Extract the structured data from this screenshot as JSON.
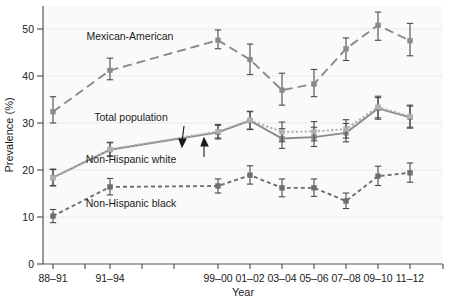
{
  "chart_data": {
    "type": "line",
    "title": "",
    "xlabel": "Year",
    "ylabel": "Prevalence (%)",
    "categories": [
      "88–91",
      "91–94",
      "99–00",
      "01–02",
      "03–04",
      "05–06",
      "07–08",
      "09–10",
      "11–12"
    ],
    "x_positions": [
      53,
      110,
      218,
      250,
      282,
      314,
      346,
      378,
      410
    ],
    "ylim": [
      0,
      54
    ],
    "yticks": [
      0,
      10,
      20,
      30,
      40,
      50
    ],
    "ytick_labels": [
      "0",
      "10",
      "20",
      "30",
      "40",
      "50"
    ],
    "grid": "horizontal-light",
    "legend": "inline-annotations",
    "series": [
      {
        "name": "Mexican-American",
        "style": "long-dash",
        "color": "#8a8a8a",
        "values": [
          32.4,
          41.2,
          47.6,
          43.5,
          37.0,
          38.3,
          45.8,
          50.8,
          47.5
        ],
        "err_low": [
          30.0,
          39.2,
          45.8,
          40.3,
          33.8,
          35.6,
          43.3,
          47.6,
          44.3
        ],
        "err_high": [
          35.6,
          43.8,
          49.8,
          46.8,
          40.6,
          41.4,
          48.1,
          53.6,
          51.2
        ]
      },
      {
        "name": "Total population",
        "style": "solid",
        "color": "#8a8a8a",
        "values": [
          18.4,
          24.3,
          28.0,
          30.5,
          26.7,
          27.0,
          27.9,
          33.1,
          31.2
        ],
        "err_low": [
          16.7,
          22.9,
          26.6,
          28.6,
          24.6,
          25.0,
          26.0,
          30.8,
          28.9
        ],
        "err_high": [
          20.2,
          25.8,
          29.5,
          32.4,
          28.8,
          29.1,
          29.9,
          35.4,
          33.6
        ]
      },
      {
        "name": "Non-Hispanic white",
        "style": "dotted",
        "color": "#b0b0b0",
        "values": [
          18.3,
          24.4,
          28.2,
          30.6,
          28.1,
          28.2,
          28.7,
          33.4,
          31.4
        ],
        "err_low": [
          16.6,
          23.0,
          26.8,
          28.7,
          26.0,
          26.2,
          26.8,
          31.1,
          29.1
        ],
        "err_high": [
          20.1,
          25.9,
          29.7,
          32.5,
          30.2,
          30.3,
          30.7,
          35.7,
          33.8
        ]
      },
      {
        "name": "Non-Hispanic black",
        "style": "short-dash",
        "color": "#6e6e6e",
        "values": [
          10.2,
          16.4,
          16.6,
          18.9,
          16.2,
          16.2,
          13.4,
          18.7,
          19.4
        ],
        "err_low": [
          8.8,
          14.7,
          15.1,
          17.0,
          14.3,
          14.4,
          11.8,
          16.7,
          17.4
        ],
        "err_high": [
          11.6,
          18.2,
          18.1,
          20.9,
          18.1,
          18.1,
          15.1,
          20.8,
          21.5
        ]
      }
    ],
    "annotations": [
      {
        "name": "mexican-american-label",
        "text": "Mexican-American",
        "x": 130,
        "y": 40
      },
      {
        "name": "total-population-label",
        "text": "Total population",
        "x": 131,
        "y": 121
      },
      {
        "name": "non-hispanic-white-label",
        "text": "Non-Hispanic white",
        "x": 131,
        "y": 163
      },
      {
        "name": "non-hispanic-black-label",
        "text": "Non-Hispanic black",
        "x": 131,
        "y": 207
      }
    ]
  }
}
